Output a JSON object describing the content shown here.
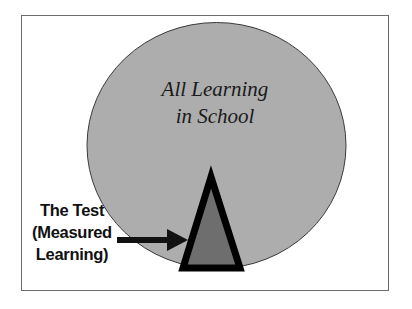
{
  "diagram": {
    "type": "nested-shapes",
    "circle": {
      "label_line1": "All Learning",
      "label_line2": "in School",
      "fill": "#adadad",
      "stroke": "#3a3a3a"
    },
    "triangle": {
      "fill": "#6e6e6e",
      "stroke": "#000000"
    },
    "callout": {
      "line1": "The Test",
      "line2": "(Measured",
      "line3": "Learning)",
      "arrow_color": "#111111"
    },
    "frame_border": "#6a6a6a"
  }
}
